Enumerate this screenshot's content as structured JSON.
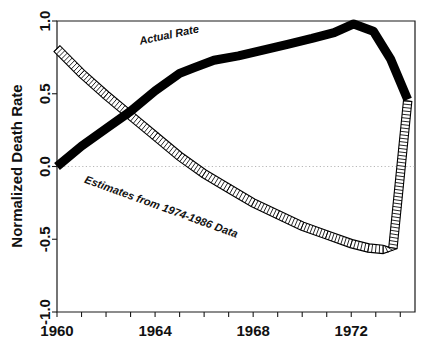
{
  "chart_data": {
    "type": "line",
    "title": "",
    "xlabel": "",
    "ylabel": "Normalized Death Rate",
    "xlim": [
      1960,
      1974.6
    ],
    "ylim": [
      -1.0,
      1.0
    ],
    "grid": false,
    "zero_reference_line": true,
    "x_tick_labels": [
      "1960",
      "1964",
      "1968",
      "1972"
    ],
    "x_tick_values": [
      1960,
      1964,
      1968,
      1972
    ],
    "x_minor_ticks": [
      1960,
      1961,
      1962,
      1963,
      1964,
      1965,
      1966,
      1967,
      1968,
      1969,
      1970,
      1971,
      1972,
      1973,
      1974
    ],
    "y_tick_labels": [
      "1.0",
      "0.5",
      "0.0",
      "-0.5",
      "-1.0"
    ],
    "y_tick_values": [
      1.0,
      0.5,
      0.0,
      -0.5,
      -1.0
    ],
    "series": [
      {
        "name": "Actual Rate",
        "style": "thick-solid-black",
        "color": "#000000",
        "x": [
          1960.0,
          1961.0,
          1962.0,
          1963.0,
          1964.0,
          1965.0,
          1965.6,
          1966.4,
          1967.4,
          1968.4,
          1969.4,
          1970.4,
          1971.3,
          1972.1,
          1972.9,
          1973.6,
          1974.3
        ],
        "values": [
          0.0,
          0.14,
          0.26,
          0.38,
          0.52,
          0.64,
          0.68,
          0.73,
          0.76,
          0.8,
          0.84,
          0.88,
          0.92,
          0.98,
          0.93,
          0.74,
          0.46
        ]
      },
      {
        "name": "Estimates from 1974-1986 Data",
        "style": "hatched-band",
        "color": "#000000",
        "x": [
          1960.0,
          1961.0,
          1962.0,
          1963.0,
          1964.0,
          1965.0,
          1966.0,
          1967.0,
          1968.0,
          1969.0,
          1970.0,
          1971.0,
          1972.0,
          1972.7,
          1973.3,
          1973.7,
          1974.3
        ],
        "values": [
          0.81,
          0.64,
          0.49,
          0.35,
          0.21,
          0.07,
          -0.05,
          -0.15,
          -0.25,
          -0.33,
          -0.41,
          -0.47,
          -0.53,
          -0.56,
          -0.57,
          -0.56,
          0.45
        ]
      }
    ],
    "annotations": [
      {
        "text": "Actual Rate",
        "x": 1964.6,
        "y": 0.88,
        "rotation": -12
      },
      {
        "text": "Estimates from 1974-1986 Data",
        "x": 1964.2,
        "y": -0.3,
        "rotation": 20
      }
    ]
  }
}
